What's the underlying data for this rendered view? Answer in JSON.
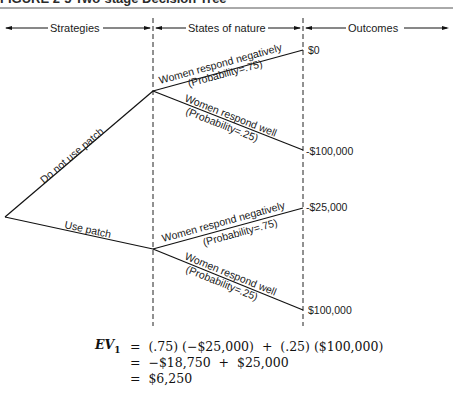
{
  "figure": {
    "title": "FIGURE 2-5  Two-stage Decision Tree"
  },
  "headers": {
    "strategies": "Strategies",
    "states_of_nature": "States of nature",
    "outcomes": "Outcomes"
  },
  "strategies": [
    {
      "label": "Do not use patch",
      "states": [
        {
          "label": "Women respond negatively",
          "probability": "(Probability=.75)",
          "outcome": "$0"
        },
        {
          "label": "Women respond well",
          "probability": "(Probability=.25)",
          "outcome": "-$100,000"
        }
      ]
    },
    {
      "label": "Use patch",
      "states": [
        {
          "label": "Women respond negatively",
          "probability": "(Probability=.75)",
          "outcome": "-$25,000"
        },
        {
          "label": "Women respond well",
          "probability": "(Probability=.25)",
          "outcome": "$100,000"
        }
      ]
    }
  ],
  "equation": {
    "lhs": "EV",
    "subscript": "1",
    "lines": [
      "=  (.75) (−$25,000)  +  (.25) ($100,000)",
      "=  −$18,750  +  $25,000",
      "=  $6,250"
    ]
  }
}
